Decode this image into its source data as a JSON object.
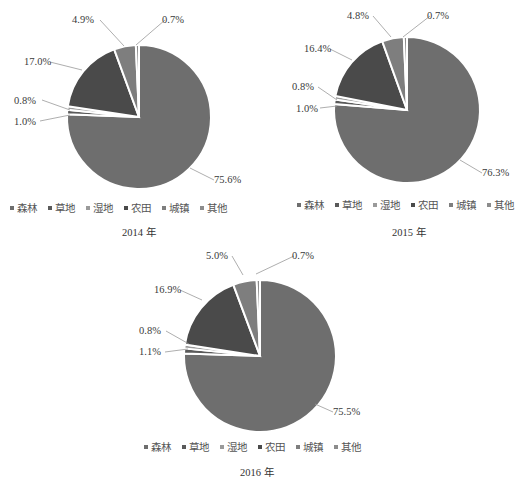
{
  "legend": {
    "items": [
      {
        "label": "森林",
        "color": "#6e6e6e"
      },
      {
        "label": "草地",
        "color": "#5a5a5a"
      },
      {
        "label": "湿地",
        "color": "#9a9a9a"
      },
      {
        "label": "农田",
        "color": "#4a4a4a"
      },
      {
        "label": "城镇",
        "color": "#7e7e7e"
      },
      {
        "label": "其他",
        "color": "#8c8c8c"
      }
    ]
  },
  "chart_data": [
    {
      "type": "pie",
      "title": "2014 年",
      "categories": [
        "森林",
        "草地",
        "湿地",
        "农田",
        "城镇",
        "其他"
      ],
      "values": [
        75.6,
        1.0,
        0.8,
        17.0,
        4.9,
        0.7
      ],
      "labels": [
        "75.6%",
        "1.0%",
        "0.8%",
        "17.0%",
        "4.9%",
        "0.7%"
      ],
      "legend_position": "bottom",
      "start_angle": "12 o'clock, clockwise"
    },
    {
      "type": "pie",
      "title": "2015 年",
      "categories": [
        "森林",
        "草地",
        "湿地",
        "农田",
        "城镇",
        "其他"
      ],
      "values": [
        76.3,
        1.0,
        0.8,
        16.4,
        4.8,
        0.7
      ],
      "labels": [
        "76.3%",
        "1.0%",
        "0.8%",
        "16.4%",
        "4.8%",
        "0.7%"
      ],
      "legend_position": "bottom",
      "start_angle": "12 o'clock, clockwise"
    },
    {
      "type": "pie",
      "title": "2016 年",
      "categories": [
        "森林",
        "草地",
        "湿地",
        "农田",
        "城镇",
        "其他"
      ],
      "values": [
        75.5,
        1.1,
        0.8,
        16.9,
        5.0,
        0.7
      ],
      "labels": [
        "75.5%",
        "1.1%",
        "0.8%",
        "16.9%",
        "5.0%",
        "0.7%"
      ],
      "legend_position": "bottom",
      "start_angle": "12 o'clock, clockwise"
    }
  ]
}
